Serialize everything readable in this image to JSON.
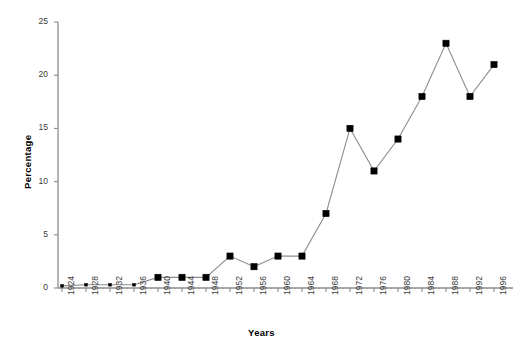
{
  "chart_data": {
    "type": "line",
    "title": "",
    "xlabel": "Years",
    "ylabel": "Percentage",
    "xlim": [
      1924,
      1996
    ],
    "ylim": [
      0,
      25
    ],
    "yticks": [
      0,
      5,
      10,
      15,
      20,
      25
    ],
    "grid": false,
    "legend": null,
    "marker": "square",
    "line_color": "#8c8c8c",
    "marker_color": "#000000",
    "axis_color": "#8c8c8c",
    "x": [
      1924,
      1928,
      1932,
      1936,
      1940,
      1944,
      1948,
      1952,
      1956,
      1960,
      1964,
      1968,
      1972,
      1976,
      1980,
      1984,
      1988,
      1992,
      1996
    ],
    "categories": [
      "1924",
      "1928",
      "1932",
      "1936",
      "1940",
      "1944",
      "1948",
      "1952",
      "1956",
      "1960",
      "1964",
      "1968",
      "1972",
      "1976",
      "1980",
      "1984",
      "1988",
      "1992",
      "1996"
    ],
    "values": [
      0.2,
      0.3,
      0.3,
      0.3,
      1,
      1,
      1,
      3,
      2,
      3,
      3,
      7,
      15,
      11,
      14,
      18,
      23,
      18,
      21
    ]
  }
}
